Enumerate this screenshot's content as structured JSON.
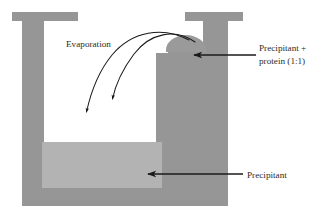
{
  "figure": {
    "background_color": "#ffffff",
    "colors": {
      "vessel_wall": "#969696",
      "precipitant_liquid": "#b3b3b3",
      "drop": "#9a9a9a",
      "interior": "#ffffff",
      "line": "#1a1a1a",
      "text": "#2b2b2b"
    }
  },
  "labels": {
    "evaporation": "Evaporation",
    "precipitant_protein_line1": "Precipitant +",
    "precipitant_protein_line2": "protein (1:1)",
    "precipitant": "Precipitant"
  },
  "annotations": {
    "evaporation_arrow_count": 2,
    "leader_lines": [
      {
        "name": "precipitant-protein-leader",
        "target": "drop"
      },
      {
        "name": "precipitant-leader",
        "target": "precipitant-reservoir"
      }
    ]
  },
  "geometry": {
    "vessel_left_wall_x": 22,
    "vessel_right_wall_x": 228,
    "vessel_top_y": 12,
    "vessel_bottom_y": 205,
    "reservoir_top_y": 142,
    "pedestal_left_x": 156,
    "drop_center_x": 186,
    "drop_center_y": 48
  }
}
